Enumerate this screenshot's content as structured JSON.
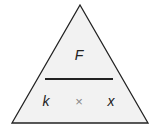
{
  "diagram": {
    "type": "formula-triangle",
    "top": "F",
    "bottom_left": "k",
    "operator": "×",
    "bottom_right": "x",
    "colors": {
      "fill": "#f2f2f2",
      "stroke": "#222222",
      "operator": "#888888"
    }
  }
}
